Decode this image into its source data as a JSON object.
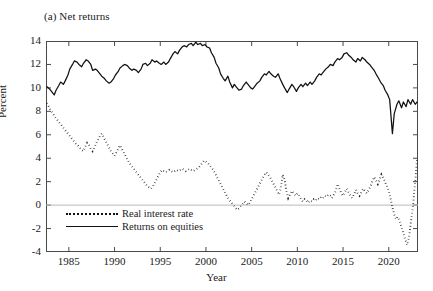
{
  "figure": {
    "panel_title": "(a) Net returns",
    "ylabel": "Percent",
    "xlabel": "Year"
  },
  "legend": {
    "items": [
      {
        "label": "Real interest rate",
        "style": "dotted"
      },
      {
        "label": "Returns on equities",
        "style": "solid"
      }
    ]
  },
  "axes": {
    "ytick_labels": [
      "14",
      "12",
      "10",
      "8",
      "6",
      "4",
      "2",
      "0",
      "-2",
      "-4"
    ],
    "xtick_labels": [
      "1985",
      "1990",
      "1995",
      "2000",
      "2005",
      "2010",
      "2015",
      "2020"
    ]
  },
  "chart_data": {
    "type": "line",
    "title": "(a) Net returns",
    "xlabel": "Year",
    "ylabel": "Percent",
    "xlim": [
      1982.5,
      2023.2
    ],
    "ylim": [
      -4,
      14
    ],
    "xticks": [
      1985,
      1990,
      1995,
      2000,
      2005,
      2010,
      2015,
      2020
    ],
    "yticks": [
      -4,
      -2,
      0,
      2,
      4,
      6,
      8,
      10,
      12,
      14
    ],
    "grid": false,
    "zero_line": true,
    "legend_position": "lower-left-inside",
    "series": [
      {
        "name": "Returns on equities",
        "style": "solid",
        "color": "#111111",
        "x": [
          1982.6,
          1982.9,
          1983.1,
          1983.4,
          1983.6,
          1983.9,
          1984.1,
          1984.4,
          1984.6,
          1984.9,
          1985.1,
          1985.4,
          1985.6,
          1985.9,
          1986.1,
          1986.4,
          1986.6,
          1986.9,
          1987.1,
          1987.4,
          1987.6,
          1987.9,
          1988.1,
          1988.4,
          1988.6,
          1988.9,
          1989.1,
          1989.4,
          1989.6,
          1989.9,
          1990.1,
          1990.4,
          1990.6,
          1990.9,
          1991.1,
          1991.4,
          1991.6,
          1991.9,
          1992.1,
          1992.4,
          1992.6,
          1992.9,
          1993.1,
          1993.4,
          1993.6,
          1993.9,
          1994.1,
          1994.4,
          1994.6,
          1994.9,
          1995.1,
          1995.4,
          1995.6,
          1995.9,
          1996.1,
          1996.4,
          1996.6,
          1996.9,
          1997.1,
          1997.4,
          1997.6,
          1997.9,
          1998.1,
          1998.4,
          1998.6,
          1998.9,
          1999.1,
          1999.4,
          1999.6,
          1999.9,
          2000.1,
          2000.4,
          2000.6,
          2000.9,
          2001.1,
          2001.4,
          2001.6,
          2001.9,
          2002.1,
          2002.4,
          2002.6,
          2002.9,
          2003.1,
          2003.4,
          2003.6,
          2003.9,
          2004.1,
          2004.4,
          2004.6,
          2004.9,
          2005.1,
          2005.4,
          2005.6,
          2005.9,
          2006.1,
          2006.4,
          2006.6,
          2006.9,
          2007.1,
          2007.4,
          2007.6,
          2007.9,
          2008.1,
          2008.4,
          2008.6,
          2008.9,
          2009.1,
          2009.4,
          2009.6,
          2009.9,
          2010.1,
          2010.4,
          2010.6,
          2010.9,
          2011.1,
          2011.4,
          2011.6,
          2011.9,
          2012.1,
          2012.4,
          2012.6,
          2012.9,
          2013.1,
          2013.4,
          2013.6,
          2013.9,
          2014.1,
          2014.4,
          2014.6,
          2014.9,
          2015.1,
          2015.4,
          2015.6,
          2015.9,
          2016.1,
          2016.4,
          2016.6,
          2016.9,
          2017.1,
          2017.4,
          2017.6,
          2017.9,
          2018.1,
          2018.4,
          2018.6,
          2018.9,
          2019.1,
          2019.4,
          2019.6,
          2019.9,
          2020.1,
          2020.4,
          2020.6,
          2020.9,
          2021.1,
          2021.4,
          2021.6,
          2021.9,
          2022.1,
          2022.4,
          2022.6,
          2022.9,
          2023.1
        ],
        "y": [
          10.1,
          9.9,
          9.7,
          9.4,
          9.8,
          10.2,
          10.5,
          10.3,
          10.6,
          11.1,
          11.6,
          12.0,
          12.3,
          12.2,
          12.0,
          11.8,
          12.1,
          12.4,
          12.3,
          12.0,
          11.5,
          11.6,
          11.5,
          11.2,
          11.0,
          10.8,
          10.6,
          10.4,
          10.5,
          10.8,
          11.1,
          11.4,
          11.7,
          11.9,
          12.0,
          11.9,
          11.7,
          11.5,
          11.6,
          11.5,
          11.3,
          11.6,
          12.0,
          12.1,
          11.9,
          12.1,
          12.4,
          12.2,
          12.3,
          12.1,
          12.0,
          12.2,
          12.0,
          12.2,
          12.5,
          12.9,
          13.1,
          12.9,
          13.2,
          13.5,
          13.6,
          13.5,
          13.7,
          13.8,
          13.6,
          13.9,
          13.7,
          13.8,
          13.6,
          13.7,
          13.5,
          13.4,
          13.0,
          12.6,
          12.1,
          11.7,
          11.2,
          10.8,
          10.6,
          11.0,
          10.5,
          10.0,
          10.3,
          10.0,
          9.8,
          9.9,
          10.2,
          10.5,
          10.3,
          10.0,
          9.9,
          10.2,
          10.4,
          10.6,
          10.9,
          11.2,
          11.1,
          11.4,
          11.2,
          11.0,
          10.9,
          11.2,
          10.8,
          10.3,
          10.0,
          9.6,
          9.9,
          10.3,
          10.1,
          9.7,
          10.0,
          10.3,
          10.1,
          10.4,
          10.2,
          10.5,
          10.3,
          10.6,
          10.9,
          11.2,
          11.1,
          11.4,
          11.6,
          11.8,
          12.0,
          11.9,
          12.2,
          12.5,
          12.4,
          12.6,
          12.9,
          13.0,
          12.8,
          12.6,
          12.4,
          12.2,
          12.5,
          12.3,
          12.6,
          12.4,
          12.2,
          12.0,
          11.8,
          11.5,
          11.2,
          10.8,
          10.5,
          10.2,
          9.8,
          9.4,
          9.0,
          6.1,
          7.8,
          8.6,
          8.9,
          8.3,
          8.8,
          8.4,
          9.0,
          8.6,
          9.0,
          8.6,
          8.8
        ]
      },
      {
        "name": "Real interest rate",
        "style": "dotted",
        "color": "#111111",
        "x": [
          1982.6,
          1982.8,
          1983.0,
          1983.2,
          1983.4,
          1983.6,
          1983.8,
          1984.0,
          1984.2,
          1984.4,
          1984.6,
          1984.8,
          1985.0,
          1985.2,
          1985.4,
          1985.6,
          1985.8,
          1986.0,
          1986.2,
          1986.4,
          1986.6,
          1986.8,
          1987.0,
          1987.2,
          1987.4,
          1987.6,
          1987.8,
          1988.0,
          1988.2,
          1988.4,
          1988.6,
          1988.8,
          1989.0,
          1989.2,
          1989.4,
          1989.6,
          1989.8,
          1990.0,
          1990.2,
          1990.4,
          1990.6,
          1990.8,
          1991.0,
          1991.2,
          1991.4,
          1991.6,
          1991.8,
          1992.0,
          1992.2,
          1992.4,
          1992.6,
          1992.8,
          1993.0,
          1993.2,
          1993.4,
          1993.6,
          1993.8,
          1994.0,
          1994.2,
          1994.4,
          1994.6,
          1994.8,
          1995.0,
          1995.2,
          1995.4,
          1995.6,
          1995.8,
          1996.0,
          1996.2,
          1996.4,
          1996.6,
          1996.8,
          1997.0,
          1997.2,
          1997.4,
          1997.6,
          1997.8,
          1998.0,
          1998.2,
          1998.4,
          1998.6,
          1998.8,
          1999.0,
          1999.2,
          1999.4,
          1999.6,
          1999.8,
          2000.0,
          2000.2,
          2000.4,
          2000.6,
          2000.8,
          2001.0,
          2001.2,
          2001.4,
          2001.6,
          2001.8,
          2002.0,
          2002.2,
          2002.4,
          2002.6,
          2002.8,
          2003.0,
          2003.2,
          2003.4,
          2003.6,
          2003.8,
          2004.0,
          2004.2,
          2004.4,
          2004.6,
          2004.8,
          2005.0,
          2005.2,
          2005.4,
          2005.6,
          2005.8,
          2006.0,
          2006.2,
          2006.4,
          2006.6,
          2006.8,
          2007.0,
          2007.2,
          2007.4,
          2007.6,
          2007.8,
          2008.0,
          2008.2,
          2008.4,
          2008.6,
          2008.8,
          2009.0,
          2009.2,
          2009.4,
          2009.6,
          2009.8,
          2010.0,
          2010.2,
          2010.4,
          2010.6,
          2010.8,
          2011.0,
          2011.2,
          2011.4,
          2011.6,
          2011.8,
          2012.0,
          2012.2,
          2012.4,
          2012.6,
          2012.8,
          2013.0,
          2013.2,
          2013.4,
          2013.6,
          2013.8,
          2014.0,
          2014.2,
          2014.4,
          2014.6,
          2014.8,
          2015.0,
          2015.2,
          2015.4,
          2015.6,
          2015.8,
          2016.0,
          2016.2,
          2016.4,
          2016.6,
          2016.8,
          2017.0,
          2017.2,
          2017.4,
          2017.6,
          2017.8,
          2018.0,
          2018.2,
          2018.4,
          2018.6,
          2018.8,
          2019.0,
          2019.2,
          2019.4,
          2019.6,
          2019.8,
          2020.0,
          2020.2,
          2020.4,
          2020.6,
          2020.8,
          2021.0,
          2021.2,
          2021.4,
          2021.6,
          2021.8,
          2022.0,
          2022.2,
          2022.4,
          2022.6,
          2022.8,
          2023.0,
          2023.1
        ],
        "y": [
          8.7,
          8.4,
          8.1,
          7.9,
          7.6,
          7.4,
          7.2,
          7.0,
          6.8,
          6.6,
          6.4,
          6.2,
          6.0,
          5.8,
          5.6,
          5.4,
          5.2,
          5.1,
          4.9,
          4.7,
          4.6,
          5.0,
          5.3,
          5.1,
          4.8,
          4.6,
          4.9,
          5.3,
          5.6,
          5.9,
          6.1,
          5.8,
          5.5,
          5.2,
          4.9,
          4.6,
          4.4,
          4.2,
          4.5,
          4.8,
          5.1,
          4.8,
          4.5,
          4.2,
          3.9,
          3.6,
          3.4,
          3.2,
          3.0,
          2.8,
          2.6,
          2.4,
          2.2,
          2.0,
          1.8,
          1.6,
          1.5,
          1.4,
          1.6,
          1.9,
          2.2,
          2.5,
          2.8,
          3.0,
          2.9,
          2.8,
          2.9,
          3.0,
          2.9,
          2.8,
          2.9,
          3.0,
          2.9,
          3.0,
          3.1,
          3.0,
          2.9,
          3.0,
          3.1,
          3.0,
          2.9,
          3.0,
          3.1,
          3.2,
          3.4,
          3.6,
          3.8,
          3.7,
          3.6,
          3.4,
          3.2,
          3.0,
          2.7,
          2.4,
          2.1,
          1.8,
          1.5,
          1.2,
          0.9,
          0.6,
          0.4,
          0.2,
          0.0,
          -0.2,
          -0.4,
          -0.3,
          -0.1,
          0.1,
          0.3,
          0.2,
          0.0,
          0.2,
          0.5,
          0.8,
          1.1,
          1.4,
          1.7,
          2.0,
          2.3,
          2.6,
          2.8,
          2.6,
          2.4,
          2.1,
          1.8,
          1.5,
          1.2,
          0.9,
          1.5,
          2.6,
          2.2,
          1.2,
          0.6,
          0.9,
          1.2,
          1.0,
          0.8,
          1.0,
          0.8,
          0.5,
          0.3,
          0.5,
          0.4,
          0.2,
          0.4,
          0.3,
          0.5,
          0.4,
          0.6,
          0.5,
          0.7,
          0.6,
          0.8,
          0.7,
          0.9,
          0.8,
          0.6,
          0.9,
          1.2,
          1.8,
          1.4,
          1.0,
          0.8,
          1.1,
          1.4,
          1.1,
          0.8,
          0.6,
          0.9,
          1.3,
          1.0,
          0.8,
          1.1,
          1.4,
          1.2,
          1.0,
          1.3,
          1.6,
          2.0,
          2.4,
          2.1,
          1.8,
          2.2,
          2.6,
          2.3,
          2.0,
          1.6,
          1.2,
          0.6,
          -0.2,
          -0.8,
          -1.2,
          -1.0,
          -1.4,
          -1.9,
          -2.4,
          -2.9,
          -3.4,
          -2.8,
          -1.6,
          -0.4,
          1.2,
          3.0,
          4.0
        ]
      }
    ]
  }
}
